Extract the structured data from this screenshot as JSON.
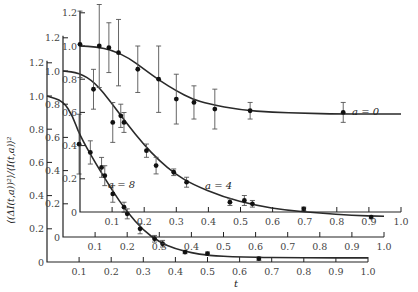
{
  "chart_data": {
    "type": "scatter",
    "title": "",
    "xlabel": "t",
    "ylabel": "⟨(ΔI(t,a))²⟩/⟨I(t,a)⟩²",
    "xlim": [
      0,
      1.0
    ],
    "ylim": [
      0,
      1.2
    ],
    "x_ticks": [
      "0.1",
      "0.2",
      "0.3",
      "0.4",
      "0.5",
      "0.6",
      "0.7",
      "0.8",
      "0.9",
      "1.0"
    ],
    "y_ticks": [
      "0",
      "0.2",
      "0.4",
      "0.6",
      "0.8",
      "1.0",
      "1.2"
    ],
    "layout": "three offset (staggered) axes panels, one per series",
    "series": [
      {
        "name": "a = 0",
        "label": "a = 0",
        "panel_origin_px": [
          80,
          212
        ],
        "x": [
          0.0,
          0.06,
          0.09,
          0.12,
          0.18,
          0.245,
          0.3,
          0.355,
          0.42,
          0.53,
          0.82
        ],
        "y": [
          1.01,
          1.0,
          0.99,
          0.96,
          0.86,
          0.8,
          0.68,
          0.66,
          0.62,
          0.61,
          0.6
        ],
        "err": [
          0.2,
          0.25,
          0.15,
          0.2,
          0.14,
          0.2,
          0.15,
          0.1,
          0.12,
          0.05,
          0.06
        ],
        "fit": [
          [
            0,
            1.0
          ],
          [
            0.05,
            0.995
          ],
          [
            0.1,
            0.975
          ],
          [
            0.15,
            0.93
          ],
          [
            0.2,
            0.86
          ],
          [
            0.25,
            0.79
          ],
          [
            0.3,
            0.73
          ],
          [
            0.35,
            0.68
          ],
          [
            0.4,
            0.65
          ],
          [
            0.5,
            0.615
          ],
          [
            0.6,
            0.6
          ],
          [
            0.7,
            0.595
          ],
          [
            0.8,
            0.59
          ],
          [
            1.0,
            0.59
          ]
        ]
      },
      {
        "name": "a = 4",
        "label": "a = 4",
        "panel_origin_px": [
          63,
          237
        ],
        "x": [
          0.095,
          0.155,
          0.18,
          0.19,
          0.26,
          0.29,
          0.345,
          0.385,
          0.52,
          0.565,
          0.59,
          0.75,
          0.96
        ],
        "y": [
          0.89,
          0.69,
          0.73,
          0.69,
          0.52,
          0.43,
          0.39,
          0.33,
          0.21,
          0.22,
          0.2,
          0.17,
          0.12
        ],
        "err": [
          0.12,
          0.12,
          0.07,
          0.06,
          0.04,
          0.05,
          0.02,
          0.03,
          0.02,
          0.03,
          0.02,
          0.01,
          0.01
        ],
        "fit": [
          [
            0,
            1.0
          ],
          [
            0.05,
            0.99
          ],
          [
            0.1,
            0.93
          ],
          [
            0.15,
            0.81
          ],
          [
            0.2,
            0.68
          ],
          [
            0.25,
            0.56
          ],
          [
            0.3,
            0.46
          ],
          [
            0.35,
            0.38
          ],
          [
            0.4,
            0.32
          ],
          [
            0.5,
            0.24
          ],
          [
            0.6,
            0.19
          ],
          [
            0.7,
            0.16
          ],
          [
            0.8,
            0.145
          ],
          [
            0.9,
            0.13
          ],
          [
            1.0,
            0.125
          ]
        ]
      },
      {
        "name": "a = 8",
        "label": "a = 8",
        "panel_origin_px": [
          47,
          262
        ],
        "x": [
          0.1,
          0.135,
          0.17,
          0.18,
          0.205,
          0.24,
          0.25,
          0.29,
          0.335,
          0.36,
          0.43,
          0.5,
          0.66
        ],
        "y": [
          0.71,
          0.66,
          0.57,
          0.52,
          0.41,
          0.33,
          0.29,
          0.2,
          0.14,
          0.11,
          0.06,
          0.05,
          0.02
        ],
        "err": [
          0.18,
          0.07,
          0.06,
          0.06,
          0.05,
          0.03,
          0.03,
          0.03,
          0.02,
          0.02,
          0.01,
          0.01,
          0.01
        ],
        "fit": [
          [
            0,
            1.0
          ],
          [
            0.05,
            0.97
          ],
          [
            0.08,
            0.88
          ],
          [
            0.1,
            0.77
          ],
          [
            0.15,
            0.6
          ],
          [
            0.2,
            0.44
          ],
          [
            0.25,
            0.3
          ],
          [
            0.3,
            0.19
          ],
          [
            0.35,
            0.12
          ],
          [
            0.4,
            0.08
          ],
          [
            0.45,
            0.055
          ],
          [
            0.5,
            0.04
          ],
          [
            0.6,
            0.03
          ],
          [
            0.8,
            0.025
          ],
          [
            1.0,
            0.025
          ]
        ]
      }
    ],
    "grid": false,
    "legend": "inline labels next to curves"
  },
  "labels": {
    "xlabel": "t",
    "ylabel": "⟨(ΔI(t,a))²⟩/⟨I(t,a)⟩²",
    "a0": "a = 0",
    "a4": "a = 4",
    "a8": "a = 8"
  },
  "annotation_pos": {
    "a0": [
      352,
      115
    ],
    "a4": [
      205,
      189
    ],
    "a8": [
      108,
      188
    ]
  }
}
